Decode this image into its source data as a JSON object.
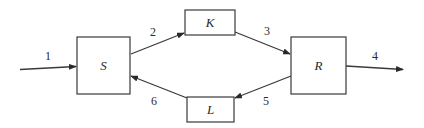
{
  "diagram": {
    "type": "flow",
    "nodes": [
      {
        "id": "S",
        "label": "S",
        "x": 77,
        "y": 37,
        "w": 53,
        "h": 57
      },
      {
        "id": "K",
        "label": "K",
        "x": 185,
        "y": 10,
        "w": 50,
        "h": 25
      },
      {
        "id": "R",
        "label": "R",
        "x": 291,
        "y": 37,
        "w": 55,
        "h": 57
      },
      {
        "id": "L",
        "label": "L",
        "x": 187,
        "y": 97,
        "w": 47,
        "h": 25
      }
    ],
    "edges": [
      {
        "id": "e1",
        "label": "1",
        "from": "input",
        "to": "S"
      },
      {
        "id": "e2",
        "label": "2",
        "from": "S",
        "to": "K"
      },
      {
        "id": "e3",
        "label": "3",
        "from": "K",
        "to": "R"
      },
      {
        "id": "e4",
        "label": "4",
        "from": "R",
        "to": "output"
      },
      {
        "id": "e5",
        "label": "5",
        "from": "R",
        "to": "L"
      },
      {
        "id": "e6",
        "label": "6",
        "from": "L",
        "to": "S"
      }
    ]
  }
}
